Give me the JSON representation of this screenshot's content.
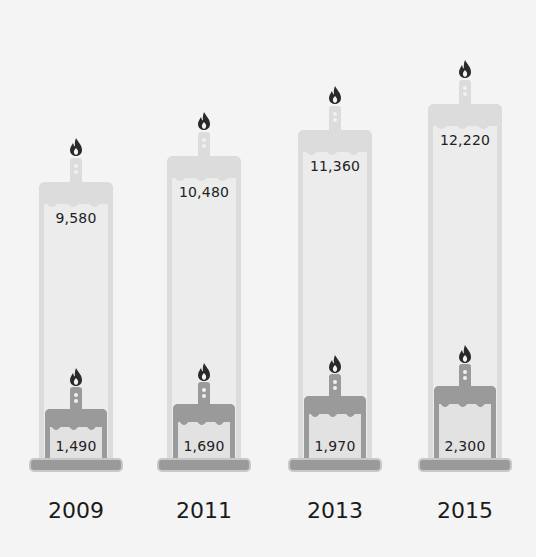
{
  "chart_data": {
    "type": "bar",
    "title": "",
    "xlabel": "",
    "ylabel": "",
    "categories": [
      "2009",
      "2011",
      "2013",
      "2015"
    ],
    "series": [
      {
        "name": "Total (tall candle)",
        "values": [
          9580,
          10480,
          11360,
          12220
        ]
      },
      {
        "name": "Subset (small candle)",
        "values": [
          1490,
          1690,
          1970,
          2300
        ]
      }
    ],
    "labels": {
      "total": [
        "9,580",
        "10,480",
        "11,360",
        "12,220"
      ],
      "subset": [
        "1,490",
        "1,690",
        "1,970",
        "2,300"
      ]
    },
    "grid": false,
    "legend": "none",
    "style": "pictogram candles (birthday-cake candles), overlaid: tall light candle = total, short dark candle = subset"
  },
  "colors": {
    "background": "#f4f4f4",
    "tall_candle_fill": "#ececec",
    "tall_candle_edge": "#dcdcdc",
    "small_candle_fill": "#e2e2e2",
    "small_candle_edge": "#9a9a9a",
    "flame": "#2a2a2a",
    "text": "#222222"
  },
  "icons": {
    "flame": "flame-icon",
    "candle": "candle-icon"
  }
}
